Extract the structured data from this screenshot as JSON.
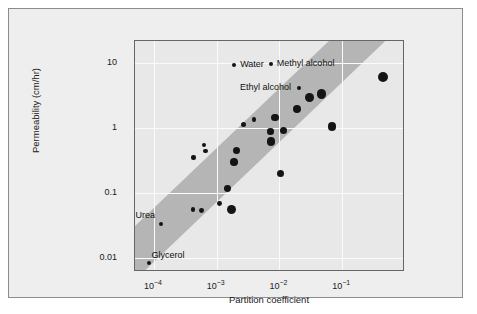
{
  "chart_data": {
    "type": "scatter",
    "title": "",
    "xlabel": "Partition coefficient",
    "ylabel": "Permeability (cm/hr)",
    "xscale": "log",
    "yscale": "log",
    "xlim": [
      5e-05,
      1.0
    ],
    "ylim": [
      0.006,
      22
    ],
    "grid": true,
    "legend": "none",
    "xtick_labels": [
      "10-4",
      "10-3",
      "10-2",
      "10-1"
    ],
    "xtick_bases": [
      "10",
      "10",
      "10",
      "10"
    ],
    "xtick_exponents": [
      "−4",
      "−3",
      "−2",
      "−1"
    ],
    "xtick_values": [
      0.0001,
      0.001,
      0.01,
      0.1
    ],
    "ytick_labels": [
      "10",
      "1",
      "0.1",
      "0.01"
    ],
    "ytick_values": [
      10,
      1,
      0.1,
      0.01
    ],
    "band": {
      "description": "shaded diagonal correlation band",
      "color": "#b5b5b5",
      "slope": 1.0,
      "lower_line": [
        [
          7e-05,
          0.006
        ],
        [
          0.5,
          22
        ]
      ],
      "upper_line": [
        [
          2e-05,
          0.013
        ],
        [
          0.12,
          22
        ]
      ]
    },
    "points": [
      {
        "x": 8.5e-05,
        "y": 0.0082,
        "r": 2.0,
        "label": "Glycerol"
      },
      {
        "x": 0.00013,
        "y": 0.033,
        "r": 2.0,
        "label": "Urea"
      },
      {
        "x": 0.00042,
        "y": 0.056,
        "r": 2.4,
        "label": ""
      },
      {
        "x": 0.00057,
        "y": 0.053,
        "r": 2.4,
        "label": ""
      },
      {
        "x": 0.00043,
        "y": 0.35,
        "r": 2.2,
        "label": ""
      },
      {
        "x": 0.00063,
        "y": 0.55,
        "r": 1.9,
        "label": ""
      },
      {
        "x": 0.00067,
        "y": 0.44,
        "r": 2.3,
        "label": ""
      },
      {
        "x": 0.0011,
        "y": 0.069,
        "r": 2.4,
        "label": ""
      },
      {
        "x": 0.0015,
        "y": 0.115,
        "r": 3.4,
        "label": ""
      },
      {
        "x": 0.0017,
        "y": 0.056,
        "r": 4.6,
        "label": ""
      },
      {
        "x": 0.0019,
        "y": 0.3,
        "r": 3.8,
        "label": ""
      },
      {
        "x": 0.0021,
        "y": 0.45,
        "r": 3.6,
        "label": ""
      },
      {
        "x": 0.0027,
        "y": 1.15,
        "r": 2.5,
        "label": ""
      },
      {
        "x": 0.0039,
        "y": 1.35,
        "r": 2.1,
        "label": ""
      },
      {
        "x": 0.0072,
        "y": 0.88,
        "r": 3.3,
        "label": ""
      },
      {
        "x": 0.0073,
        "y": 0.62,
        "r": 4.2,
        "label": ""
      },
      {
        "x": 0.0085,
        "y": 1.45,
        "r": 3.9,
        "label": ""
      },
      {
        "x": 0.0115,
        "y": 0.92,
        "r": 3.6,
        "label": ""
      },
      {
        "x": 0.0105,
        "y": 0.2,
        "r": 3.6,
        "label": ""
      },
      {
        "x": 0.019,
        "y": 1.95,
        "r": 3.9,
        "label": ""
      },
      {
        "x": 0.03,
        "y": 2.95,
        "r": 4.4,
        "label": ""
      },
      {
        "x": 0.047,
        "y": 3.35,
        "r": 4.6,
        "label": ""
      },
      {
        "x": 0.068,
        "y": 1.05,
        "r": 4.2,
        "label": ""
      },
      {
        "x": 0.44,
        "y": 6.2,
        "r": 5.0,
        "label": ""
      },
      {
        "x": 0.0019,
        "y": 9.3,
        "r": 2.1,
        "label": "Water"
      },
      {
        "x": 0.0073,
        "y": 9.6,
        "r": 2.1,
        "label": "Methyl alcohol"
      },
      {
        "x": 0.0205,
        "y": 4.1,
        "r": 2.1,
        "label": "Ethyl alcohol"
      }
    ],
    "annotations": [
      {
        "text": "Water",
        "marker": "left"
      },
      {
        "text": "Methyl alcohol",
        "marker": "left"
      },
      {
        "text": "Ethyl alcohol",
        "marker": "right"
      },
      {
        "text": "Urea",
        "marker": "above"
      },
      {
        "text": "Glycerol",
        "marker": "above"
      }
    ]
  },
  "figure": {
    "background": "#eeeeee",
    "plot_background": "#e8e8e8",
    "point_color": "#141414",
    "band_color": "#b5b5b5",
    "grid_color": "#fbfbfb",
    "axis_color": "#666666"
  }
}
